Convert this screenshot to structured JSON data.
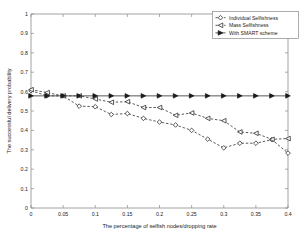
{
  "chart_data": {
    "type": "line",
    "title": "",
    "xlabel": "The percentage of selfish nodes/dropping rate",
    "ylabel": "The successful delivery probability",
    "xlim": [
      0,
      0.4
    ],
    "ylim": [
      0,
      1
    ],
    "grid": false,
    "legend_position": "top-right",
    "xticks": [
      0,
      0.05,
      0.1,
      0.15,
      0.2,
      0.25,
      0.3,
      0.35,
      0.4
    ],
    "xticklabels": [
      "0",
      "0.05",
      "0.1",
      "0.15",
      "0.2",
      "0.25",
      "0.3",
      "0.35",
      "0.4"
    ],
    "yticks": [
      0,
      0.1,
      0.2,
      0.3,
      0.4,
      0.5,
      0.6,
      0.7,
      0.8,
      0.9,
      1
    ],
    "yticklabels": [
      "0",
      "0.1",
      "0.2",
      "0.3",
      "0.4",
      "0.5",
      "0.6",
      "0.7",
      "0.8",
      "0.9",
      "1"
    ],
    "x": [
      0,
      0.025,
      0.05,
      0.075,
      0.1,
      0.125,
      0.15,
      0.175,
      0.2,
      0.225,
      0.25,
      0.275,
      0.3,
      0.325,
      0.35,
      0.375,
      0.4
    ],
    "series": [
      {
        "name": "Individual Selfishness",
        "marker": "diamond-open",
        "linestyle": "dashed",
        "color": "#2e2e2e",
        "values": [
          0.605,
          0.578,
          0.578,
          0.525,
          0.522,
          0.482,
          0.487,
          0.462,
          0.443,
          0.428,
          0.4,
          0.355,
          0.31,
          0.334,
          0.334,
          0.352,
          0.283
        ]
      },
      {
        "name": "Mass Selfishness",
        "marker": "triangle-left-open",
        "linestyle": "dashed",
        "color": "#2e2e2e",
        "values": [
          0.61,
          0.595,
          0.578,
          0.578,
          0.562,
          0.545,
          0.548,
          0.518,
          0.518,
          0.478,
          0.49,
          0.462,
          0.45,
          0.392,
          0.385,
          0.354,
          0.358
        ]
      },
      {
        "name": "With SMART scheme",
        "marker": "triangle-right-filled",
        "linestyle": "solid",
        "color": "#1a1a1a",
        "values": [
          0.578,
          0.578,
          0.578,
          0.578,
          0.578,
          0.578,
          0.578,
          0.578,
          0.578,
          0.578,
          0.578,
          0.578,
          0.578,
          0.578,
          0.578,
          0.578,
          0.578
        ]
      }
    ]
  },
  "legend": {
    "items": [
      {
        "label": "Individual Selfishness"
      },
      {
        "label": "Mass Selfishness"
      },
      {
        "label": "With SMART scheme"
      }
    ]
  }
}
